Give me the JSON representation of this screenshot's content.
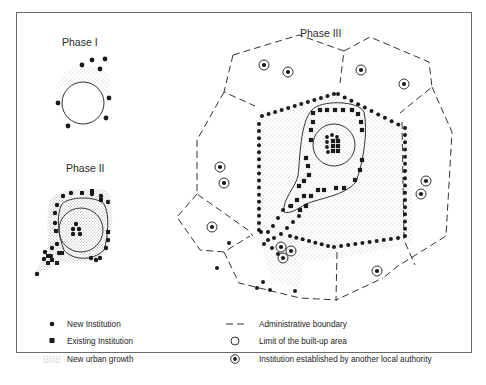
{
  "figure": {
    "phases": [
      {
        "id": "phase-1",
        "title": "Phase I"
      },
      {
        "id": "phase-2",
        "title": "Phase II"
      },
      {
        "id": "phase-3",
        "title": "Phase III"
      }
    ],
    "legend": {
      "left": [
        {
          "symbol": "filled-dot",
          "label": "New Institution"
        },
        {
          "symbol": "filled-square",
          "label": "Existing Institution"
        },
        {
          "symbol": "stipple",
          "label": "New urban growth"
        }
      ],
      "right": [
        {
          "symbol": "dashed-line",
          "label": "Administrative boundary"
        },
        {
          "symbol": "open-circle",
          "label": "Limit of the built-up area"
        },
        {
          "symbol": "ringed-dot",
          "label": "Institution established by another local authority"
        }
      ]
    },
    "colors": {
      "ink": "#1a1a1a",
      "frame": "#6a6a6a",
      "stipple": "#9a9a9a",
      "background": "#ffffff"
    }
  }
}
